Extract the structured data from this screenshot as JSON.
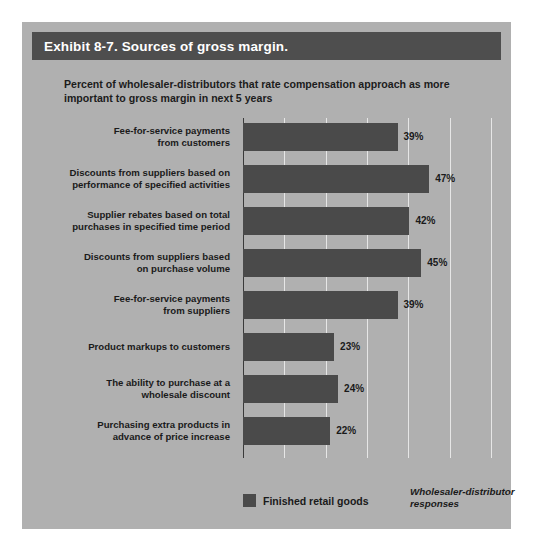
{
  "exhibit": {
    "header_title": "Exhibit 8-7. Sources of gross margin.",
    "subtitle": "Percent of wholesaler-distributors that rate compensation approach as more important to gross margin in next 5 years",
    "legend_label": "Finished retail goods",
    "axis_note": "Wholesaler-distributor responses"
  },
  "chart_data": {
    "type": "bar",
    "orientation": "horizontal",
    "title": "Exhibit 8-7. Sources of gross margin.",
    "subtitle": "Percent of wholesaler-distributors that rate compensation approach as more important to gross margin in next 5 years",
    "xlabel": "",
    "ylabel": "",
    "xlim": [
      0,
      62.6
    ],
    "grid": true,
    "gridlines": [
      0,
      10.43,
      20.87,
      31.3,
      41.73,
      52.17,
      62.6
    ],
    "legend": [
      {
        "name": "Finished retail goods",
        "color": "#4a4a4a"
      }
    ],
    "legend_position": "bottom-left",
    "annotations": [
      "Wholesaler-distributor responses"
    ],
    "value_suffix": "%",
    "categories": [
      "Fee-for-service payments from customers",
      "Discounts from suppliers based on performance of specified activities",
      "Supplier rebates based on total purchases in specified time period",
      "Discounts from suppliers based on purchase volume",
      "Fee-for-service payments from suppliers",
      "Product markups to customers",
      "The ability to purchase at a wholesale discount",
      "Purchasing extra products in advance of price increase"
    ],
    "values": [
      39,
      47,
      42,
      45,
      39,
      23,
      24,
      22
    ],
    "bars": [
      {
        "label_lines": [
          "Fee-for-service payments",
          "from customers"
        ],
        "value": 39,
        "value_label": "39%"
      },
      {
        "label_lines": [
          "Discounts from suppliers based on",
          "performance of specified activities"
        ],
        "value": 47,
        "value_label": "47%"
      },
      {
        "label_lines": [
          "Supplier rebates based on total",
          "purchases in specified time period"
        ],
        "value": 42,
        "value_label": "42%"
      },
      {
        "label_lines": [
          "Discounts from suppliers based",
          "on purchase volume"
        ],
        "value": 45,
        "value_label": "45%"
      },
      {
        "label_lines": [
          "Fee-for-service payments",
          "from suppliers"
        ],
        "value": 39,
        "value_label": "39%"
      },
      {
        "label_lines": [
          "Product markups to customers"
        ],
        "value": 23,
        "value_label": "23%"
      },
      {
        "label_lines": [
          "The ability to purchase at a",
          "wholesale discount"
        ],
        "value": 24,
        "value_label": "24%"
      },
      {
        "label_lines": [
          "Purchasing extra products in",
          "advance of price increase"
        ],
        "value": 22,
        "value_label": "22%"
      }
    ]
  },
  "colors": {
    "card_background": "#b0b0b0",
    "header_background": "#4e4e4e",
    "header_text": "#ffffff",
    "bar": "#4a4a4a",
    "gridline": "#e6e6e6",
    "axis": "#3a3a3a",
    "text": "#1a1a1a"
  }
}
